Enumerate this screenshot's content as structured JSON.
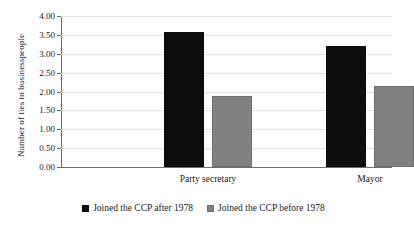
{
  "chart_data": {
    "type": "bar",
    "title": "",
    "xlabel": "",
    "ylabel": "Number of ties to businesspeople",
    "categories": [
      "Party secretary",
      "Mayor"
    ],
    "series": [
      {
        "name": "Joined the CCP after 1978",
        "color": "#0d0d0d",
        "values": [
          3.58,
          3.2
        ]
      },
      {
        "name": "Joined the CCP before 1978",
        "color": "#808080",
        "values": [
          1.88,
          2.15
        ]
      }
    ],
    "ylim": [
      0,
      4.0
    ],
    "ytick_step": 0.5,
    "ytick_labels": [
      "0.00",
      "0.50",
      "1.00",
      "1.50",
      "2.00",
      "2.50",
      "3.00",
      "3.50",
      "4.00"
    ],
    "grid": "horizontal",
    "legend_position": "bottom-center"
  },
  "axis": {
    "ticks": [
      {
        "label": "4.00",
        "value": 4.0
      },
      {
        "label": "3.50",
        "value": 3.5
      },
      {
        "label": "3.00",
        "value": 3.0
      },
      {
        "label": "2.50",
        "value": 2.5
      },
      {
        "label": "2.00",
        "value": 2.0
      },
      {
        "label": "1.50",
        "value": 1.5
      },
      {
        "label": "1.00",
        "value": 1.0
      },
      {
        "label": "0.50",
        "value": 0.5
      },
      {
        "label": "0.00",
        "value": 0.0
      }
    ]
  },
  "legend": {
    "items": [
      {
        "label": "Joined the CCP after 1978",
        "swatch": "black"
      },
      {
        "label": "Joined the CCP before 1978",
        "swatch": "gray"
      }
    ]
  }
}
